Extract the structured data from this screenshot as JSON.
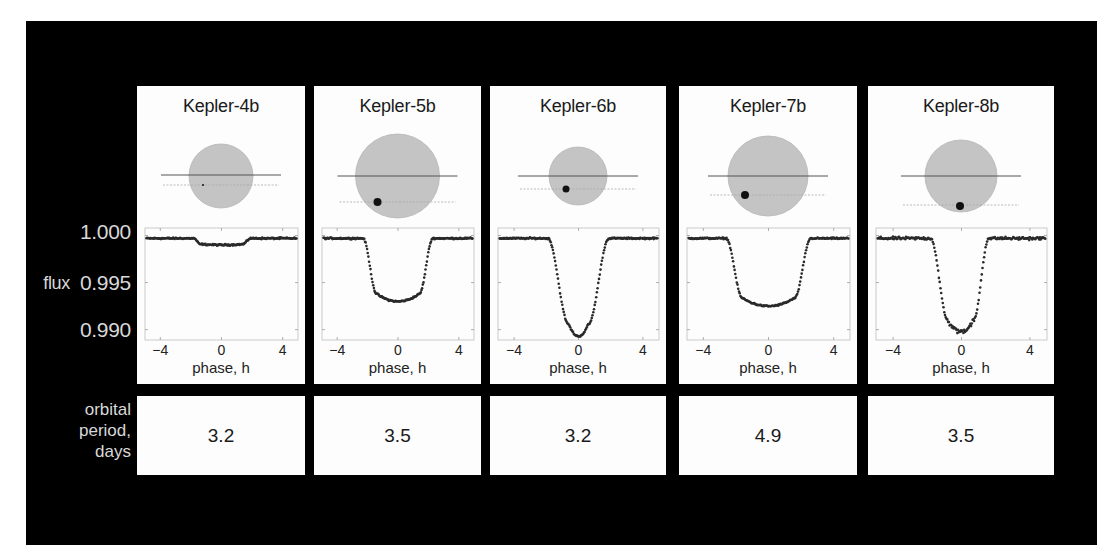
{
  "y_axis": {
    "label": "flux",
    "ticks": [
      "1.000",
      "0.995",
      "0.990"
    ]
  },
  "x_axis": {
    "label": "phase, h",
    "ticks": [
      "−4",
      "0",
      "4"
    ]
  },
  "period_row_label": [
    "orbital",
    "period,",
    "days"
  ],
  "colors": {
    "frame": "#000000",
    "panel": "#fdfdfd",
    "star": "#c4c4c4",
    "planet": "#111111",
    "data_points": "#2a2a2a",
    "axis_labels_on_black": "#d8d8d8"
  },
  "planets": [
    {
      "name": "Kepler-4b",
      "period": "3.2",
      "star_r": 32,
      "planet_r": 1,
      "planet_dx": -18,
      "planet_dy": 9,
      "orbit_dy": -1,
      "transit_dy": 9
    },
    {
      "name": "Kepler-5b",
      "period": "3.5",
      "star_r": 42,
      "planet_r": 4,
      "planet_dx": -20,
      "planet_dy": 26,
      "orbit_dy": 0,
      "transit_dy": 26
    },
    {
      "name": "Kepler-6b",
      "period": "3.2",
      "star_r": 29,
      "planet_r": 3.5,
      "planet_dx": -12,
      "planet_dy": 13,
      "orbit_dy": 0,
      "transit_dy": 13
    },
    {
      "name": "Kepler-7b",
      "period": "4.9",
      "star_r": 40,
      "planet_r": 4,
      "planet_dx": -23,
      "planet_dy": 19,
      "orbit_dy": 0,
      "transit_dy": 19
    },
    {
      "name": "Kepler-8b",
      "period": "3.5",
      "star_r": 36,
      "planet_r": 4,
      "planet_dx": -1,
      "planet_dy": 30,
      "orbit_dy": 0,
      "transit_dy": 29
    }
  ],
  "chart_data": {
    "type": "scatter",
    "xlabel": "phase, h",
    "ylabel": "flux",
    "xlim": [
      -5,
      5
    ],
    "ylim": [
      0.9889,
      1.0008
    ],
    "xticks": [
      -4,
      0,
      4
    ],
    "yticks": [
      1.0,
      0.995,
      0.99
    ],
    "grid": false,
    "series": [
      {
        "name": "Kepler-4b",
        "baseline": 1.0,
        "min_flux": 0.9993,
        "ingress_start": -1.8,
        "ingress_end": -1.4,
        "egress_start": 1.4,
        "egress_end": 1.9,
        "orbital_period_days": 3.2
      },
      {
        "name": "Kepler-5b",
        "baseline": 1.0,
        "min_flux": 0.9933,
        "ingress_start": -2.3,
        "ingress_end": -1.4,
        "egress_start": 1.4,
        "egress_end": 2.3,
        "orbital_period_days": 3.5
      },
      {
        "name": "Kepler-6b",
        "baseline": 1.0,
        "min_flux": 0.9896,
        "ingress_start": -1.9,
        "ingress_end": -0.6,
        "egress_start": 0.6,
        "egress_end": 1.9,
        "orbital_period_days": 3.2
      },
      {
        "name": "Kepler-7b",
        "baseline": 1.0,
        "min_flux": 0.9928,
        "ingress_start": -2.6,
        "ingress_end": -1.6,
        "egress_start": 1.6,
        "egress_end": 2.6,
        "orbital_period_days": 4.9
      },
      {
        "name": "Kepler-8b",
        "baseline": 1.0,
        "min_flux": 0.9901,
        "ingress_start": -1.8,
        "ingress_end": -0.8,
        "egress_start": 0.7,
        "egress_end": 1.6,
        "orbital_period_days": 3.5
      }
    ]
  }
}
